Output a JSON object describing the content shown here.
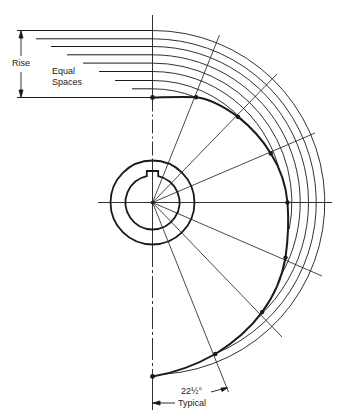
{
  "diagram": {
    "type": "cam layout construction",
    "labels": {
      "rise": "Rise",
      "equal": "Equal",
      "spaces": "Spaces",
      "angle": "22½°",
      "typical": "Typical"
    },
    "center": [
      152.5,
      202.5
    ],
    "hub": {
      "outer_radius": 42,
      "bore_radius": 27,
      "keyway": true
    },
    "angle_step_deg": 22.5,
    "cam_profile_points": [
      {
        "angle_deg": 0,
        "x": 152.5,
        "y": 97.5
      },
      {
        "angle_deg": 22.5,
        "x": 196.1,
        "y": 97.2
      },
      {
        "angle_deg": 45,
        "x": 238.1,
        "y": 116.9
      },
      {
        "angle_deg": 67.5,
        "x": 270.8,
        "y": 153.5
      },
      {
        "angle_deg": 90,
        "x": 287.5,
        "y": 202.5
      },
      {
        "angle_deg": 112.5,
        "x": 285.5,
        "y": 257.6
      },
      {
        "angle_deg": 135,
        "x": 262.1,
        "y": 312.1
      },
      {
        "angle_deg": 157.5,
        "x": 215.3,
        "y": 354.0
      },
      {
        "angle_deg": 180,
        "x": 152.5,
        "y": 376.5
      }
    ],
    "rise_lines_count": 9,
    "concentric_arcs_count": 8,
    "colors": {
      "line": "#1a1a1a",
      "background": "#ffffff"
    }
  }
}
